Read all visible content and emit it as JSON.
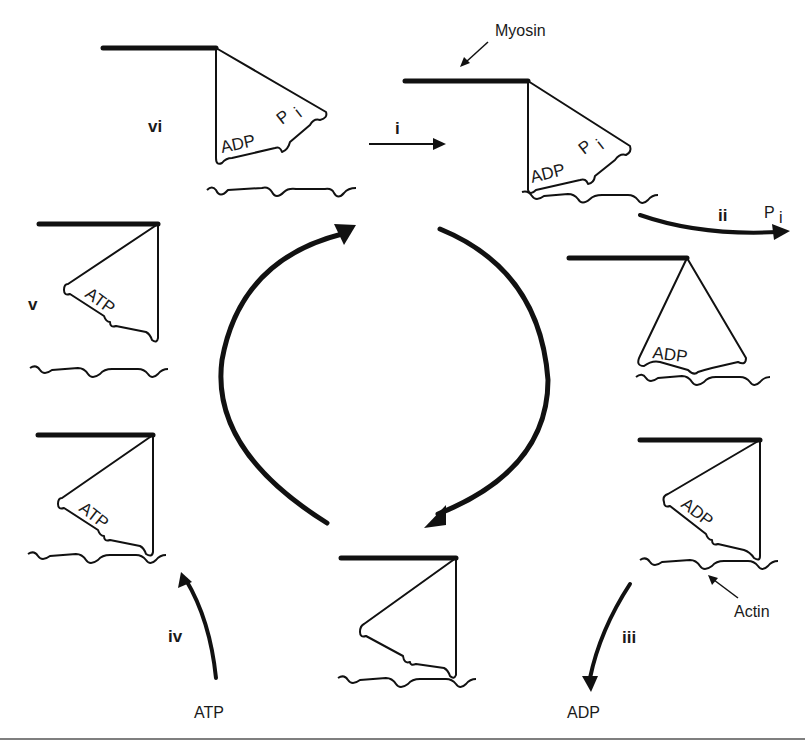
{
  "diagram": {
    "labels": {
      "myosin": "Myosin",
      "actin": "Actin"
    },
    "steps": [
      {
        "id": "i",
        "label": "i"
      },
      {
        "id": "ii",
        "label": "ii",
        "product": "P",
        "product_sub": "i"
      },
      {
        "id": "iii",
        "label": "iii",
        "product": "ADP"
      },
      {
        "id": "iv",
        "label": "iv",
        "reactant": "ATP"
      },
      {
        "id": "v",
        "label": "v"
      },
      {
        "id": "vi",
        "label": "vi"
      }
    ],
    "states": [
      {
        "name": "state-vi",
        "bound": [
          "ADP",
          "P"
        ],
        "sub": "i"
      },
      {
        "name": "state-i",
        "bound": [
          "ADP",
          "P"
        ],
        "sub": "i"
      },
      {
        "name": "state-ii",
        "bound": [
          "ADP"
        ]
      },
      {
        "name": "state-iii",
        "bound": [
          "ADP"
        ]
      },
      {
        "name": "state-rigor",
        "bound": []
      },
      {
        "name": "state-iv",
        "bound": [
          "ATP"
        ]
      },
      {
        "name": "state-v",
        "bound": [
          "ATP"
        ]
      }
    ],
    "colors": {
      "ink": "#111111",
      "background": "#ffffff"
    }
  }
}
